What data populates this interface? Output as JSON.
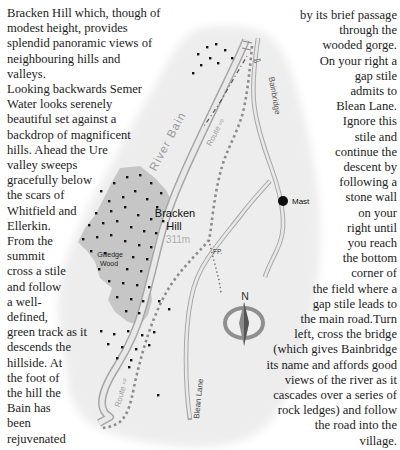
{
  "article": {
    "left_column": "Bracken Hill which, though of\nmodest height, provides\nsplendid panoramic views of\nneighbouring hills and\nvalleys.\nLooking backwards Semer\nWater looks serenely\nbeautiful set against a\nbackdrop of magnificent\nhills. Ahead the Ure\nvalley sweeps\ngracefully below\nthe scars of\nWhitfield and\nEllerkin.\nFrom the\nsummit\ncross a stile\nand follow\na well-\ndefined,\ngreen track as it\ndescends the\nhillside. At\nthe foot of\nthe hill the\nBain has\nbeen\nrejuvenated",
    "right_column": "by its brief passage\nthrough the\nwooded gorge.\nOn your right a\ngap stile\nadmits to\nBlean Lane.\nIgnore this\nstile and\ncontinue the\ndescent by\nfollowing a\nstone wall\non your\nright until\nyou reach\nthe bottom\ncorner of\nthe field where a\ngap stile leads to\nthe main road.Turn\nleft, cross the bridge\n(which gives Bainbridge\nits name and affords good\nviews of the river as it\ncascades over a series of\nrock ledges) and follow\nthe road into the\nvillage."
  },
  "map": {
    "labels": {
      "river": "River Bain",
      "bainbridge": "Bainbridge",
      "bainbridge_arrow": "⇦",
      "hill_name_line1": "Bracken",
      "hill_name_line2": "Hill",
      "hill_elevation": "311m",
      "wood_name_line1": "Gilledge",
      "wood_name_line2": "Wood",
      "footpath": "FP.",
      "mast": "Mast",
      "route_upper": "Route ⇨",
      "route_lower": "Route ⇨",
      "lane": "Blean Lane",
      "compass_north": "N"
    },
    "colors": {
      "map_bg": "#ededed",
      "wood_fill": "#c6c6c6",
      "river_casing": "#a6a6a6",
      "river_fill": "#e9e9e9",
      "road_casing": "#a8a8a8",
      "road_fill": "#e8e8e8",
      "route_dash": "#8c8c8c",
      "label_gray": "#9b9b9b",
      "body_text": "#1c1c1c"
    },
    "tree_dots": [
      [
        100,
        190
      ],
      [
        113,
        182
      ],
      [
        126,
        176
      ],
      [
        139,
        174
      ],
      [
        150,
        182
      ],
      [
        160,
        192
      ],
      [
        108,
        200
      ],
      [
        122,
        196
      ],
      [
        134,
        190
      ],
      [
        146,
        198
      ],
      [
        156,
        206
      ],
      [
        95,
        212
      ],
      [
        110,
        210
      ],
      [
        124,
        206
      ],
      [
        137,
        214
      ],
      [
        150,
        218
      ],
      [
        162,
        220
      ],
      [
        88,
        224
      ],
      [
        102,
        222
      ],
      [
        116,
        220
      ],
      [
        130,
        226
      ],
      [
        143,
        230
      ],
      [
        155,
        232
      ],
      [
        82,
        238
      ],
      [
        96,
        236
      ],
      [
        110,
        234
      ],
      [
        124,
        240
      ],
      [
        138,
        244
      ],
      [
        150,
        246
      ],
      [
        90,
        250
      ],
      [
        104,
        252
      ],
      [
        132,
        256
      ],
      [
        146,
        258
      ],
      [
        98,
        268
      ],
      [
        126,
        268
      ],
      [
        140,
        270
      ],
      [
        108,
        280
      ],
      [
        122,
        282
      ],
      [
        136,
        284
      ],
      [
        148,
        286
      ],
      [
        116,
        296
      ],
      [
        130,
        298
      ],
      [
        142,
        300
      ],
      [
        125,
        310
      ],
      [
        138,
        312
      ],
      [
        197,
        53
      ],
      [
        206,
        46
      ],
      [
        215,
        43
      ],
      [
        224,
        49
      ],
      [
        231,
        57
      ],
      [
        209,
        57
      ],
      [
        200,
        64
      ],
      [
        192,
        72
      ],
      [
        217,
        62
      ],
      [
        100,
        330
      ],
      [
        113,
        333
      ],
      [
        127,
        330
      ],
      [
        141,
        334
      ],
      [
        153,
        331
      ],
      [
        107,
        343
      ],
      [
        121,
        346
      ],
      [
        135,
        348
      ],
      [
        148,
        344
      ],
      [
        116,
        357
      ],
      [
        130,
        359
      ],
      [
        158,
        300
      ],
      [
        168,
        308
      ],
      [
        128,
        366
      ],
      [
        157,
        394
      ]
    ]
  }
}
